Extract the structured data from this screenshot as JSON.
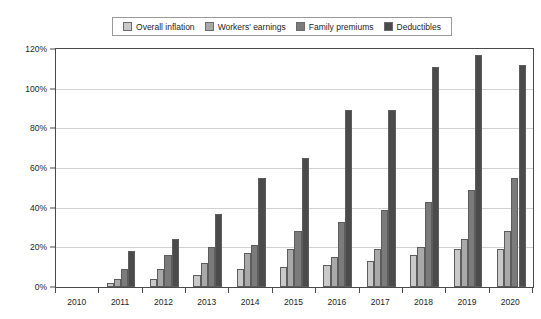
{
  "chart_data": {
    "type": "bar",
    "title": "",
    "xlabel": "",
    "ylabel": "",
    "ylim": [
      0,
      120
    ],
    "ytick_labels": [
      "0%",
      "20%",
      "40%",
      "60%",
      "80%",
      "100%",
      "120%"
    ],
    "ytick_values": [
      0,
      20,
      40,
      60,
      80,
      100,
      120
    ],
    "grid": true,
    "legend_position": "top-center",
    "categories": [
      "2010",
      "2011",
      "2012",
      "2013",
      "2014",
      "2015",
      "2016",
      "2017",
      "2018",
      "2019",
      "2020"
    ],
    "series": [
      {
        "name": "Overall inflation",
        "color": "#c9c9c9",
        "values": [
          0,
          2,
          4,
          6,
          9,
          10,
          11,
          13,
          16,
          19,
          19
        ]
      },
      {
        "name": "Workers' earnings",
        "color": "#a9a9a9",
        "values": [
          0,
          4,
          9,
          12,
          17,
          19,
          15,
          19,
          20,
          24,
          28
        ]
      },
      {
        "name": "Family premiums",
        "color": "#7b7b7b",
        "values": [
          0,
          9,
          16,
          20,
          21,
          28,
          33,
          39,
          43,
          49,
          55
        ]
      },
      {
        "name": "Deductibles",
        "color": "#4b4b4b",
        "values": [
          0,
          18,
          24,
          37,
          55,
          65,
          89,
          89,
          111,
          117,
          112
        ]
      }
    ]
  },
  "legend": {
    "items": [
      {
        "label": "Overall inflation",
        "color": "#c9c9c9"
      },
      {
        "label": "Workers' earnings",
        "color": "#a9a9a9"
      },
      {
        "label": "Family premiums",
        "color": "#7b7b7b"
      },
      {
        "label": "Deductibles",
        "color": "#4b4b4b"
      }
    ]
  }
}
